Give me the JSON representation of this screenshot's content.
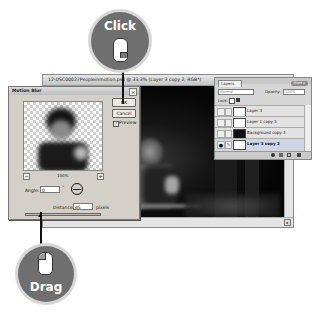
{
  "callouts": {
    "click_label": "Click",
    "drag_label": "Drag",
    "badge_color": "#6f6f6f"
  },
  "document_window": {
    "title": "12-DSC00027Peopleinmotion.psd @ 33.3% (Layer 3 copy 2, RGB*)"
  },
  "motion_blur_dialog": {
    "title": "Motion Blur",
    "ok_label": "OK",
    "cancel_label": "Cancel",
    "preview_label": "Preview",
    "preview_checked": true,
    "zoom_value": "100%",
    "zoom_out_icon": "minus",
    "zoom_in_icon": "plus",
    "angle_label": "Angle:",
    "angle_value": "0",
    "angle_unit": "°",
    "distance_label": "Distance:",
    "distance_value": "45",
    "distance_unit": "pixels"
  },
  "layers_panel": {
    "tab_label": "Layers",
    "more_label": "More ▸",
    "blend_mode": "Normal",
    "opacity_label": "Opacity:",
    "opacity_value": "100%",
    "lock_label": "Lock:",
    "layers": [
      {
        "name": "Layer 3",
        "visible": false,
        "thumb": "light"
      },
      {
        "name": "Layer 1 copy 3",
        "visible": false,
        "thumb": "light"
      },
      {
        "name": "Background copy 3",
        "visible": false,
        "thumb": "dark"
      },
      {
        "name": "Layer 3 copy 2",
        "visible": true,
        "thumb": "light",
        "active": true
      }
    ]
  }
}
